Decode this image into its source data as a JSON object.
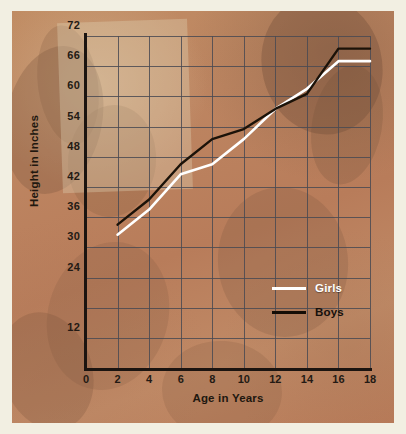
{
  "chart_data": {
    "type": "line",
    "title": "",
    "xlabel": "Age in Years",
    "ylabel": "Height in Inches",
    "xlim": [
      0,
      18
    ],
    "ylim": [
      6,
      72
    ],
    "grid": true,
    "legend_position": "inside-bottom-right",
    "xticks": [
      "0",
      "2",
      "4",
      "6",
      "8",
      "10",
      "12",
      "14",
      "16",
      "18"
    ],
    "yticks": [
      "12",
      "24",
      "30",
      "36",
      "42",
      "48",
      "54",
      "60",
      "66",
      "72"
    ],
    "x": [
      2,
      4,
      6,
      8,
      10,
      12,
      14,
      16,
      18
    ],
    "series": [
      {
        "name": "Girls",
        "color": "#ffffff",
        "values": [
          32.5,
          37.5,
          44.5,
          46.5,
          51.5,
          57.5,
          61.5,
          67.0,
          67.0
        ]
      },
      {
        "name": "Boys",
        "color": "#1b1208",
        "values": [
          34.5,
          39.5,
          46.5,
          51.5,
          53.5,
          57.5,
          60.5,
          69.5,
          69.5
        ]
      }
    ]
  },
  "legend": {
    "items": [
      {
        "label": "Girls",
        "color": "#ffffff"
      },
      {
        "label": "Boys",
        "color": "#140d06"
      }
    ]
  },
  "colors": {
    "mat": "#f2efe2",
    "panel": "#bd8561",
    "grid": "#4a4a52",
    "axis": "#1b1410",
    "text": "#231a14"
  }
}
